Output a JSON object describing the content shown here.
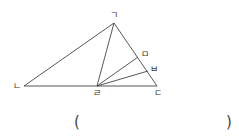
{
  "diagram": {
    "points": {
      "A": {
        "label": "ㄱ",
        "x": 114,
        "y": 23
      },
      "B": {
        "label": "ㄴ",
        "x": 24,
        "y": 86
      },
      "C": {
        "label": "ㄷ",
        "x": 157,
        "y": 86
      },
      "D": {
        "label": "ㄹ",
        "x": 97,
        "y": 86
      },
      "E": {
        "label": "ㅁ",
        "x": 138,
        "y": 57
      },
      "F": {
        "label": "ㅂ",
        "x": 148,
        "y": 71
      }
    },
    "segments": [
      "ㄱㄴ",
      "ㄴㄷ",
      "ㄱㄷ",
      "ㄱㄹ",
      "ㄹㅁ",
      "ㄹㅂ"
    ]
  },
  "answer": {
    "open": "(",
    "close": ")",
    "value": ""
  }
}
